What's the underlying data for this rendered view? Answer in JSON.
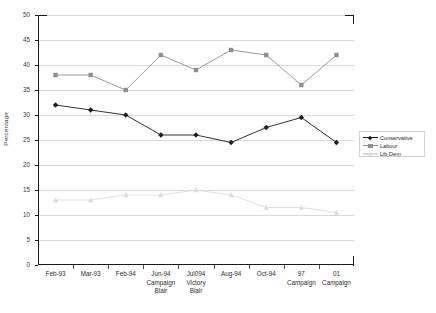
{
  "chart_data": {
    "type": "line",
    "title": "",
    "xlabel": "",
    "ylabel": "Percentage",
    "ylim": [
      0,
      50
    ],
    "ytick_step": 5,
    "yticks": [
      0,
      5,
      10,
      15,
      20,
      25,
      30,
      35,
      40,
      45,
      50
    ],
    "grid": true,
    "legend_position": "right",
    "categories": [
      "Feb-93",
      "Mar-93",
      "Feb-94",
      "Jun-94 Campaign Blair",
      "Jul094 Victory Blair",
      "Aug-94",
      "Oct-94",
      "97 Campaign",
      "01 Campaign"
    ],
    "category_lines": [
      [
        "Feb-93"
      ],
      [
        "Mar-93"
      ],
      [
        "Feb-94"
      ],
      [
        "Jun-94",
        "Campaign",
        "Blair"
      ],
      [
        "Jul094",
        "Victory",
        "Blair"
      ],
      [
        "Aug-94"
      ],
      [
        "Oct-94"
      ],
      [
        "97",
        "Campaign"
      ],
      [
        "01",
        "Campaign"
      ]
    ],
    "series": [
      {
        "name": "Conservative",
        "color": "#1c1c1c",
        "marker": "diamond",
        "values": [
          32,
          31,
          30,
          26,
          26,
          24.5,
          27.5,
          29.5,
          24.5
        ]
      },
      {
        "name": "Labour",
        "color": "#8f8f8f",
        "marker": "square",
        "values": [
          38,
          38,
          35,
          42,
          39,
          43,
          42,
          36,
          42
        ]
      },
      {
        "name": "Lib Dem",
        "color": "#dcdcdc",
        "marker": "triangle",
        "values": [
          13,
          13,
          14,
          14,
          15,
          14,
          11.5,
          11.5,
          10.5
        ]
      }
    ]
  },
  "legend": {
    "entries": [
      "Conservative",
      "Labour",
      "Lib Dem"
    ]
  },
  "axis": {
    "y_title": "Percentage"
  }
}
